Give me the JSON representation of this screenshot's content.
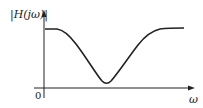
{
  "diagram": {
    "y_axis_label": "|H(jω)|",
    "x_axis_label": "ω",
    "origin_label": "0",
    "curve_color": "#222222",
    "axis_color": "#222222"
  }
}
